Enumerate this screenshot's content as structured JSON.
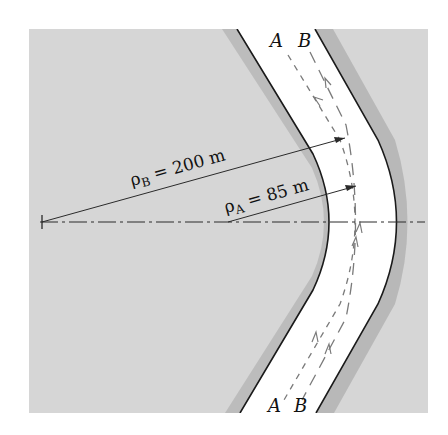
{
  "figure": {
    "type": "road-curve-diagram",
    "colors": {
      "background": "#ffffff",
      "terrain": "#d6d6d6",
      "road": "#ffffff",
      "edge": "#1a1a1a",
      "path": "#7a7a7a",
      "dimension": "#2a2a2a"
    },
    "paths": [
      {
        "id": "A",
        "label_top": "A",
        "label_bottom": "A",
        "style": "dashed"
      },
      {
        "id": "B",
        "label_top": "B",
        "label_bottom": "B",
        "style": "long-dashed"
      }
    ],
    "radii": [
      {
        "symbol": "ρ",
        "subscript": "B",
        "equals": " = ",
        "value": "200 m"
      },
      {
        "symbol": "ρ",
        "subscript": "A",
        "equals": " = ",
        "value": "85 m"
      }
    ],
    "centerline": "dash-dot"
  }
}
